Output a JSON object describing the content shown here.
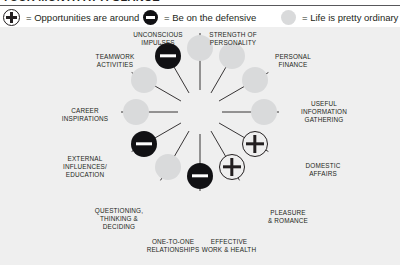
{
  "page": {
    "title": "YOUR MONTH AT A GLANCE",
    "background": "#efefef",
    "ink": "#231f20",
    "accent_dark": "#111114",
    "accent_grey": "#d9dadb"
  },
  "legend": {
    "items": [
      {
        "symbol": "plus-circle-icon",
        "label": "= Opportunities are around"
      },
      {
        "symbol": "minus-circle-icon",
        "label": "= Be on the defensive"
      },
      {
        "symbol": "plain-circle-icon",
        "label": "= Life is pretty ordinary"
      }
    ]
  },
  "wheel": {
    "sector_count": 12,
    "sectors": [
      {
        "index": 0,
        "label": "UNCONSCIOUS\nIMPULSES",
        "state": "plain",
        "state_label": "Life is pretty ordinary"
      },
      {
        "index": 1,
        "label": "STRENGTH OF\nPERSONALITY",
        "state": "plain",
        "state_label": "Life is pretty ordinary"
      },
      {
        "index": 2,
        "label": "PERSONAL\nFINANCE",
        "state": "plain",
        "state_label": "Life is pretty ordinary"
      },
      {
        "index": 3,
        "label": "USEFUL\nINFORMATION\nGATHERING",
        "state": "plain",
        "state_label": "Life is pretty ordinary"
      },
      {
        "index": 4,
        "label": "DOMESTIC\nAFFAIRS",
        "state": "plus",
        "state_label": "Opportunities are around"
      },
      {
        "index": 5,
        "label": "PLEASURE\n& ROMANCE",
        "state": "plus",
        "state_label": "Opportunities are around"
      },
      {
        "index": 6,
        "label": "EFFECTIVE\nWORK & HEALTH",
        "state": "minus",
        "state_label": "Be on the defensive"
      },
      {
        "index": 7,
        "label": "ONE-TO-ONE\nRELATIONSHIPS",
        "state": "plain",
        "state_label": "Life is pretty ordinary"
      },
      {
        "index": 8,
        "label": "QUESTIONING,\nTHINKING &\nDECIDING",
        "state": "minus",
        "state_label": "Be on the defensive"
      },
      {
        "index": 9,
        "label": "EXTERNAL\nINFLUENCES/\nEDUCATION",
        "state": "plain",
        "state_label": "Life is pretty ordinary"
      },
      {
        "index": 10,
        "label": "CAREER\nINSPIRATIONS",
        "state": "plain",
        "state_label": "Life is pretty ordinary"
      },
      {
        "index": 11,
        "label": "TEAMWORK\nACTIVITIES",
        "state": "minus",
        "state_label": "Be on the defensive"
      }
    ]
  }
}
